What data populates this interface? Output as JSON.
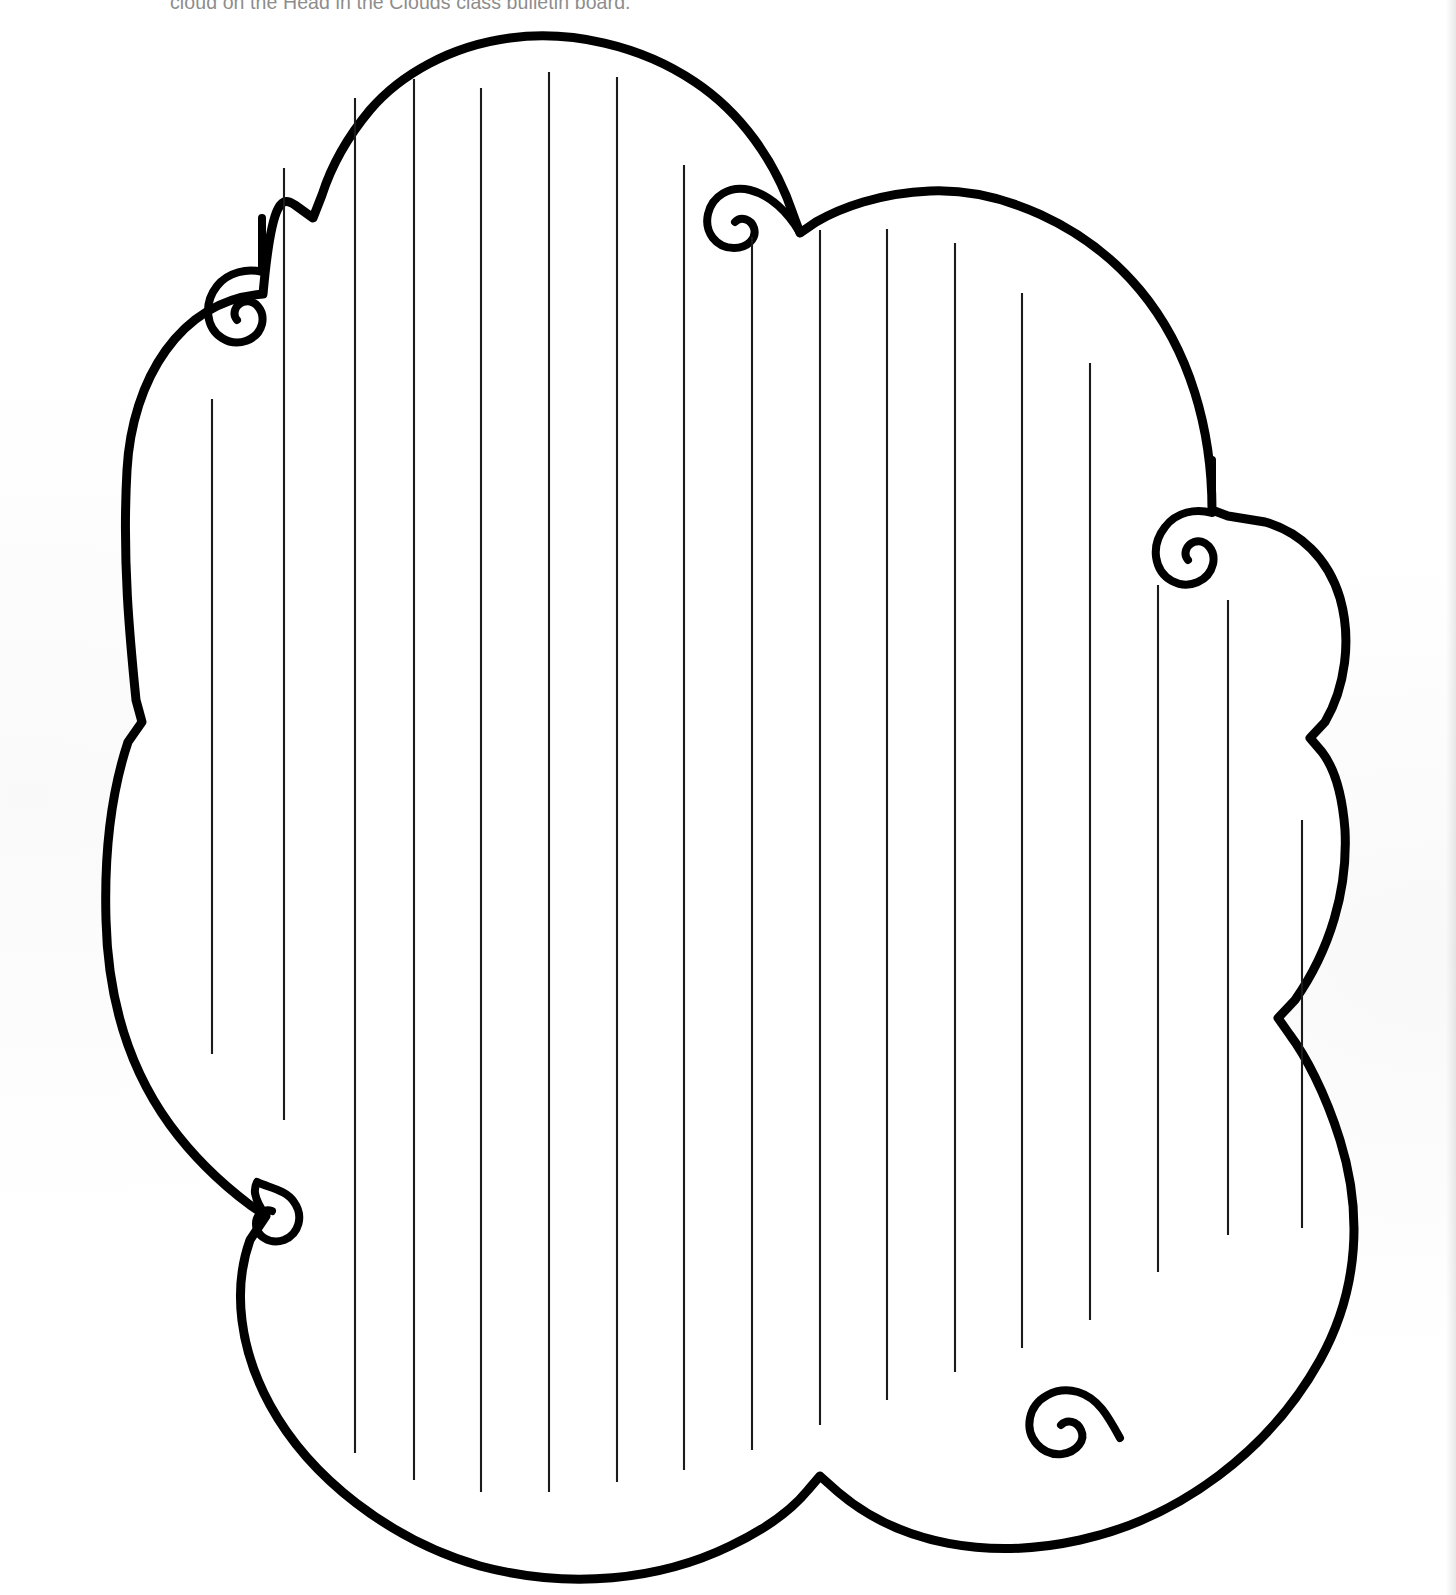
{
  "document": {
    "type": "worksheet",
    "title": "Cloud writing template",
    "page_background": "#ffffff",
    "ink_color": "#000000",
    "instruction_text": "cloud on the Head in the Clouds class bulletin board.",
    "instruction_color": "#8d8d8d",
    "instruction_cropped": true
  },
  "cloud": {
    "name": "cloud-shape",
    "fill": "#ffffff",
    "stroke": "#000000",
    "stroke_width": 9,
    "bump_count": 9,
    "curl_count": 5,
    "curls": [
      {
        "id": "curl-top-left",
        "x": 258,
        "y": 290,
        "direction": "inward-right"
      },
      {
        "id": "curl-top-center",
        "x": 727,
        "y": 173,
        "direction": "inward-left"
      },
      {
        "id": "curl-right",
        "x": 1187,
        "y": 528,
        "direction": "inward-left"
      },
      {
        "id": "curl-bottom-left",
        "x": 272,
        "y": 1211,
        "direction": "inward-right"
      },
      {
        "id": "curl-bottom-right",
        "x": 1063,
        "y": 1411,
        "direction": "inward-left"
      }
    ]
  },
  "writing_lines": {
    "name": "writing-rule-lines",
    "orientation": "vertical",
    "count": 17,
    "spacing_px": 71,
    "color": "#1b1b1b",
    "stroke_width": 2.1,
    "lines": [
      {
        "x": 212,
        "y1": 399,
        "y2": 1054
      },
      {
        "x": 284,
        "y1": 168,
        "y2": 1120
      },
      {
        "x": 355,
        "y1": 98,
        "y2": 1453
      },
      {
        "x": 414,
        "y1": 79,
        "y2": 1480
      },
      {
        "x": 481,
        "y1": 88,
        "y2": 1492
      },
      {
        "x": 549,
        "y1": 72,
        "y2": 1492
      },
      {
        "x": 617,
        "y1": 77,
        "y2": 1482
      },
      {
        "x": 684,
        "y1": 165,
        "y2": 1470
      },
      {
        "x": 752,
        "y1": 237,
        "y2": 1450
      },
      {
        "x": 820,
        "y1": 230,
        "y2": 1425
      },
      {
        "x": 887,
        "y1": 229,
        "y2": 1400
      },
      {
        "x": 955,
        "y1": 243,
        "y2": 1372
      },
      {
        "x": 1022,
        "y1": 293,
        "y2": 1348
      },
      {
        "x": 1090,
        "y1": 363,
        "y2": 1320
      },
      {
        "x": 1158,
        "y1": 585,
        "y2": 1272
      },
      {
        "x": 1228,
        "y1": 600,
        "y2": 1235
      },
      {
        "x": 1302,
        "y1": 820,
        "y2": 1228
      }
    ]
  }
}
